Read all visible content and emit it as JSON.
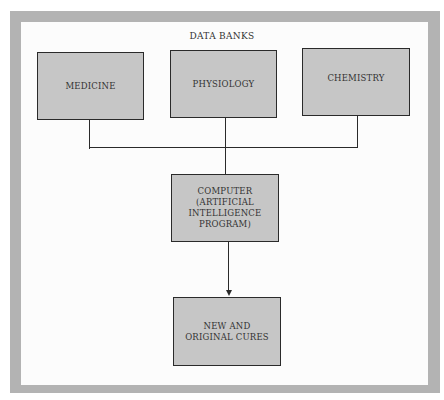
{
  "diagram": {
    "title": "DATA BANKS",
    "sources": [
      {
        "label": "MEDICINE"
      },
      {
        "label": "PHYSIOLOGY"
      },
      {
        "label": "CHEMISTRY"
      }
    ],
    "processor": {
      "label": "COMPUTER (ARTIFICIAL INTELLIGENCE PROGRAM)"
    },
    "output": {
      "label": "NEW AND ORIGINAL CURES"
    },
    "edges": [
      {
        "from": "MEDICINE",
        "to": "COMPUTER (ARTIFICIAL INTELLIGENCE PROGRAM)"
      },
      {
        "from": "PHYSIOLOGY",
        "to": "COMPUTER (ARTIFICIAL INTELLIGENCE PROGRAM)"
      },
      {
        "from": "CHEMISTRY",
        "to": "COMPUTER (ARTIFICIAL INTELLIGENCE PROGRAM)"
      },
      {
        "from": "COMPUTER (ARTIFICIAL INTELLIGENCE PROGRAM)",
        "to": "NEW AND ORIGINAL CURES",
        "arrow": true
      }
    ],
    "colors": {
      "frame": "#b3b3b3",
      "box_fill": "#c6c6c6",
      "line": "#2a2a2a"
    }
  }
}
